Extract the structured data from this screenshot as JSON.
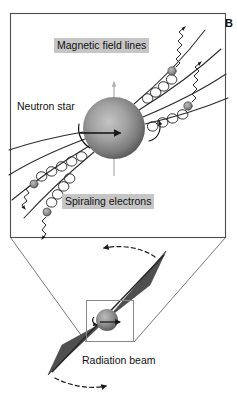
{
  "figure": {
    "panel_letter": "B",
    "background_color": "#ffffff",
    "line_color": "#222222",
    "highlight_color": "#c6c6c6",
    "beam_color": "#4a4a4a",
    "star_color_light": "#b9b9b9",
    "star_color_dark": "#5d5d5d",
    "axis_color": "#b0b0b0"
  },
  "labels": {
    "magnetic_field_lines": "Magnetic field lines",
    "neutron_star": "Neutron star",
    "spiraling_electrons": "Spiraling electrons",
    "radiation_beam": "Radiation beam"
  },
  "top_panel": {
    "name": "magnified-neutron-star-view",
    "border": {
      "x": 10,
      "y": 13,
      "width": 216,
      "height": 225
    },
    "star": {
      "cx": 114,
      "cy": 128,
      "r": 31
    },
    "spin_axis": {
      "x": 114,
      "top_y": 83,
      "bottom_y": 175
    },
    "rotation_arrows": 2,
    "field_line_count": 8,
    "electron_helix_count": 4,
    "radiation_wave_count": 4
  },
  "bottom_panel": {
    "name": "pulsar-beam-view",
    "callout_box": {
      "x": 86,
      "y": 300,
      "width": 48,
      "height": 42
    },
    "small_star": {
      "cx": 106,
      "cy": 320,
      "r": 11
    },
    "beams": [
      {
        "name": "upper-right-beam",
        "direction": "up-right"
      },
      {
        "name": "lower-left-beam",
        "direction": "down-left"
      }
    ],
    "precession_arrows": [
      {
        "name": "upper-sweep-arrow",
        "direction": "leftward"
      },
      {
        "name": "lower-sweep-arrow",
        "direction": "rightward"
      }
    ]
  }
}
